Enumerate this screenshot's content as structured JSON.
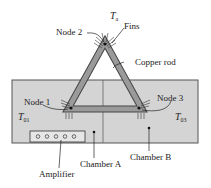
{
  "figure": {
    "labels": {
      "ambient": "T",
      "ambient_sub": "a",
      "node2": "Node 2",
      "fins": "Fins",
      "copper_rod": "Copper rod",
      "node1": "Node 1",
      "t01": "T",
      "t01_sub": "01",
      "node3": "Node 3",
      "t03": "T",
      "t03_sub": "03",
      "amplifier": "Amplifier",
      "chamber_a": "Chamber A",
      "chamber_b": "Chamber B"
    },
    "colors": {
      "chamber_fill": "#d4d4d4",
      "rod_fill": "#9a9a9a",
      "outline": "#333333"
    }
  }
}
